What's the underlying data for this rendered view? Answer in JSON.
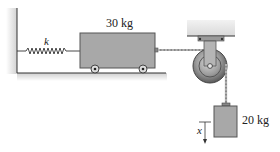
{
  "diagram": {
    "spring_label": "k",
    "cart": {
      "mass_label": "30 kg"
    },
    "hanging_block": {
      "mass_label": "20 kg"
    },
    "displacement_label": "x"
  },
  "colors": {
    "block_fill": "#a9a9a9",
    "block_stroke": "#555555",
    "ground_shade": "#d6d6d6",
    "line": "#333333",
    "ceiling_fill": "#e4e4e4",
    "pulley_dark": "#6e6e6e",
    "pulley_light": "#bdbdbd"
  }
}
